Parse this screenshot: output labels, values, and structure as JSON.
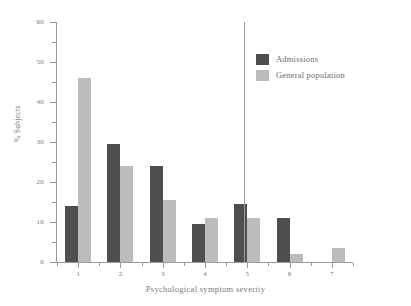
{
  "chart_data": {
    "type": "bar",
    "title": "",
    "subtitle": "",
    "xlabel": "Psychological symptom severity",
    "ylabel": "% Subjects",
    "categories": [
      "1",
      "2",
      "3",
      "4",
      "5",
      "6",
      "7"
    ],
    "series": [
      {
        "name": "Admissions",
        "color": "#4f4f4f",
        "values": [
          14,
          29.5,
          24,
          9.5,
          14.5,
          11,
          0
        ]
      },
      {
        "name": "General population",
        "color": "#bcbcbc",
        "values": [
          46,
          24,
          15.5,
          11,
          11,
          2,
          3.5
        ]
      }
    ],
    "ylim": [
      0,
      60
    ],
    "yticks_major": [
      0,
      10,
      20,
      30,
      40,
      50,
      60
    ],
    "yticks_minor": [
      5,
      15,
      25,
      35,
      45,
      55
    ],
    "grid": false,
    "legend_position": "top-right",
    "annotations": [
      {
        "type": "vertical-line",
        "name": "severity-threshold-divider",
        "between_categories": [
          "4",
          "5"
        ]
      }
    ],
    "axis_color": "#9a9a9a",
    "text_color": "#7a7a7a",
    "background": "#ffffff"
  }
}
